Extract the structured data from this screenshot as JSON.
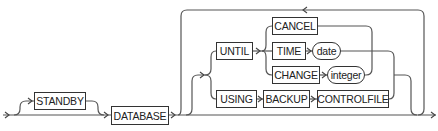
{
  "diagram": {
    "type": "railroad-syntax",
    "keywords": {
      "standby": "STANDBY",
      "database": "DATABASE",
      "until": "UNTIL",
      "using": "USING",
      "cancel": "CANCEL",
      "time": "TIME",
      "change": "CHANGE",
      "backup": "BACKUP",
      "controlfile": "CONTROLFILE"
    },
    "variables": {
      "date": "date",
      "integer": "integer"
    },
    "colors": {
      "line": "#555555",
      "border": "#333333",
      "text": "#222222",
      "background": "#ffffff"
    }
  }
}
